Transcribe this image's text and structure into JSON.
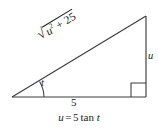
{
  "figure": {
    "type": "right-triangle-trig-diagram",
    "caption": {
      "variable": "u",
      "equals": "=",
      "coefficient": "5",
      "function": "tan",
      "argument": "t",
      "full_text": "u = 5 tan t"
    },
    "labels": {
      "hypotenuse": {
        "radical_glyph": "√",
        "radicand_variable": "u",
        "radicand_exponent": "2",
        "radicand_operator": "+",
        "radicand_constant": "25",
        "full_text": "√(u² + 25)"
      },
      "base": {
        "text": "5"
      },
      "vertical_leg": {
        "text": "u"
      },
      "angle": {
        "text": "t"
      }
    },
    "geometry": {
      "left_vertex": "12,97",
      "bottom_right_vertex": "146,97",
      "apex_vertex": "146,16",
      "right_angle_marker": "bottom-right",
      "angle_arc": "left-vertex"
    },
    "colors": {
      "stroke": "#3d3d3d",
      "text": "#1c1c1c",
      "background": "#ffffff"
    }
  }
}
